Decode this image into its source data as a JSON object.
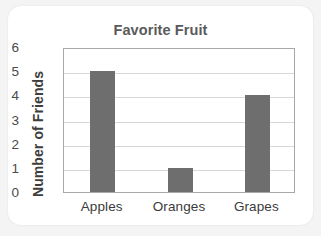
{
  "chart_data": {
    "type": "bar",
    "title": "Favorite Fruit",
    "xlabel": "",
    "ylabel": "Number of Friends",
    "categories": [
      "Apples",
      "Oranges",
      "Grapes"
    ],
    "values": [
      5,
      1,
      4
    ],
    "ylim": [
      0,
      6
    ],
    "yticks": [
      0,
      1,
      2,
      3,
      4,
      5,
      6
    ],
    "ytick_labels": [
      "0",
      "1",
      "2",
      "3",
      "4",
      "5",
      "6"
    ],
    "grid": "horizontal",
    "legend": "none",
    "colors": {
      "bar_fill": "#6e6e6e",
      "gridline": "#d8d8d8",
      "plot_border": "#a8a8a8",
      "title_text": "#5a5a5a",
      "axis_text": "#3b3b3b",
      "ylabel_text": "#3d3d3d",
      "card_background": "#ffffff",
      "page_background": "#f4f4f4"
    }
  }
}
